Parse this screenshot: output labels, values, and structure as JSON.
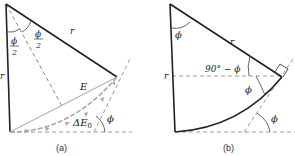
{
  "panels": [
    {
      "id": "a",
      "caption": "(a)",
      "labels": {
        "half_angle_left": "ϕ",
        "half_angle_right": "ϕ",
        "half_den": "2",
        "radius_top": "r",
        "radius_left": "r",
        "chord": "E",
        "arc_delta": "ΔE",
        "arc_sub": "0",
        "angle_phi": "ϕ"
      }
    },
    {
      "id": "b",
      "caption": "(b)",
      "labels": {
        "apex_angle": "ϕ",
        "radius_top": "r",
        "radius_left": "r",
        "complement_angle": "90° − ϕ",
        "inner_angle": "ϕ",
        "outer_angle": "ϕ"
      }
    }
  ],
  "colors": {
    "line": "#222222",
    "dashed": "#9a9a9a",
    "arc_arrows": "#a8a8a8",
    "chord": "#b5b5b5"
  }
}
